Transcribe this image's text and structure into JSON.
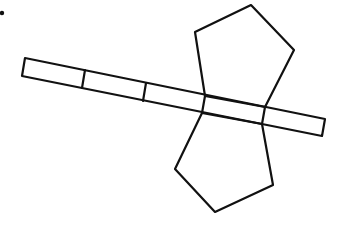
{
  "diagram": {
    "colors": {
      "stroke": "#111111",
      "background": "#ffffff"
    },
    "marker_dot": {
      "x": 2,
      "y": 13,
      "r": 2.2
    },
    "strip": {
      "outline": [
        [
          25,
          58
        ],
        [
          325,
          119
        ],
        [
          322,
          136
        ],
        [
          22,
          76
        ]
      ],
      "dividers": [
        [
          [
            85,
            70
          ],
          [
            82,
            88
          ]
        ],
        [
          [
            146,
            83
          ],
          [
            143,
            101
          ]
        ],
        [
          [
            205,
            96
          ],
          [
            202,
            113
          ]
        ],
        [
          [
            265,
            107
          ],
          [
            262,
            124
          ]
        ]
      ]
    },
    "top_pentagon": {
      "points": [
        [
          205,
          96
        ],
        [
          195,
          32
        ],
        [
          251,
          5
        ],
        [
          294,
          50
        ],
        [
          265,
          107
        ]
      ]
    },
    "bottom_pentagon": {
      "points": [
        [
          202,
          113
        ],
        [
          175,
          169
        ],
        [
          215,
          212
        ],
        [
          273,
          185
        ],
        [
          262,
          124
        ]
      ]
    }
  }
}
